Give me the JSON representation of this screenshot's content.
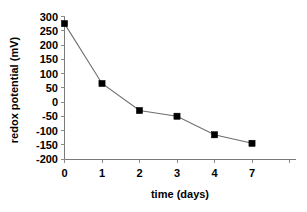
{
  "chart_data": {
    "type": "line",
    "title": "",
    "subtitle": "",
    "xlabel": "time (days)",
    "ylabel": "redox potential (mV)",
    "categories": [
      "0",
      "1",
      "2",
      "3",
      "4",
      "7"
    ],
    "values": [
      275,
      65,
      -30,
      -50,
      -115,
      -145
    ],
    "series": [
      {
        "name": "redox potential",
        "values": [
          275,
          65,
          -30,
          -50,
          -115,
          -145
        ],
        "marker": "filled-square",
        "marker_color": "#000000",
        "line_color": "#6e6e6e"
      }
    ],
    "ylim": [
      -200,
      300
    ],
    "ytick_labels": [
      "300",
      "250",
      "200",
      "150",
      "100",
      "50",
      "0",
      "-50",
      "-100",
      "-150",
      "-200"
    ],
    "ytick_values": [
      300,
      250,
      200,
      150,
      100,
      50,
      0,
      -50,
      -100,
      -150,
      -200
    ],
    "xtick_labels": [
      "0",
      "1",
      "2",
      "3",
      "4",
      "7"
    ],
    "grid": false,
    "legend": false,
    "legend_position": "none",
    "background_color": "#ffffff",
    "axis_color": "#7a7a7a"
  },
  "axes": {
    "y_title": "redox potential (mV)",
    "x_title": "time (days)"
  },
  "ytick": {
    "t0": "300",
    "t1": "250",
    "t2": "200",
    "t3": "150",
    "t4": "100",
    "t5": "50",
    "t6": "0",
    "t7": "-50",
    "t8": "-100",
    "t9": "-150",
    "t10": "-200"
  },
  "xtick": {
    "t0": "0",
    "t1": "1",
    "t2": "2",
    "t3": "3",
    "t4": "4",
    "t5": "7"
  }
}
